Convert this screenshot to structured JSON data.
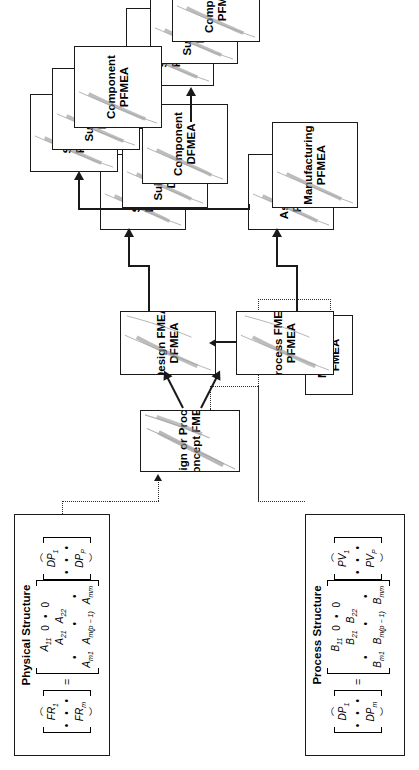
{
  "diagram": {
    "orientation": "rotated-90-ccw",
    "colors": {
      "stroke": "#1a1a1a",
      "background": "#ffffff",
      "swoosh": "#8c8c8c"
    }
  },
  "nodes": {
    "concept": {
      "line1": "Design or Process",
      "line2": "Concept FMEA"
    },
    "design_fmea": {
      "line1": "Design FMEA",
      "line2": "DFMEA"
    },
    "process_fmea": {
      "line1": "Process  FMEA",
      "line2": "PFMEA"
    },
    "machine_fmea": {
      "line1": "Machine",
      "line2": "FMEA"
    },
    "dfmea_stack": [
      {
        "line1": "System",
        "line2": "DFMEA"
      },
      {
        "line1": "Sub-system",
        "line2": "DFMEA"
      },
      {
        "line1": "Component",
        "line2": "DFMEA"
      }
    ],
    "pfmea_mid": [
      {
        "line1": "Assembly",
        "line2": "PFMEA"
      },
      {
        "line1": "Manufacturing",
        "line2": "PFMEA"
      }
    ],
    "pfmea_stack_upper": [
      {
        "line1": "System",
        "line2": "PFMEA"
      },
      {
        "line1": "Sub-system",
        "line2": "PFMEA"
      },
      {
        "line1": "Component",
        "line2": "PFMEA"
      }
    ],
    "pfmea_stack_lower": [
      {
        "line1": "System",
        "line2": "PFMEA"
      },
      {
        "line1": "Sub-system",
        "line2": "PFMEA"
      },
      {
        "line1": "Component",
        "line2": "PFMEA"
      }
    ]
  },
  "physical_structure": {
    "title": "Physical Structure",
    "lhs": {
      "first": "FR",
      "first_sub": "1",
      "dots": "•   •   •",
      "last": "FR",
      "last_sub": "m"
    },
    "equals": "=",
    "matrix": {
      "r1": [
        "A",
        "11",
        "0",
        "",
        "0"
      ],
      "r2": [
        "A",
        "21",
        "A",
        "22",
        "",
        "0"
      ],
      "r3": [
        "A",
        "m1",
        "",
        "",
        "A",
        "m(p − 1)",
        "A",
        "mm"
      ],
      "cells_text": {
        "a11": "A",
        "a11s": "11",
        "a21": "A",
        "a21s": "21",
        "am1": "A",
        "am1s": "m1",
        "zero1": "0",
        "a22": "A",
        "a22s": "22",
        "zero2": "0",
        "amp": "A",
        "amps": "m(p − 1)",
        "amm": "A",
        "amms": "mm",
        "dot": "•"
      }
    },
    "rhs": {
      "first": "DP",
      "first_sub": "1",
      "dots": "•   •   •",
      "last": "DP",
      "last_sub": "P"
    }
  },
  "process_structure": {
    "title": "Process Structure",
    "lhs": {
      "first": "DP",
      "first_sub": "1",
      "dots": "•   •   •",
      "last": "DP",
      "last_sub": "m"
    },
    "equals": "=",
    "matrix": {
      "cells_text": {
        "a11": "B",
        "a11s": "11",
        "a21": "B",
        "a21s": "21",
        "am1": "B",
        "am1s": "m1",
        "zero1": "0",
        "a22": "B",
        "a22s": "22",
        "zero2": "0",
        "amp": "B",
        "amps": "m(p − 1)",
        "amm": "B",
        "amms": "mm",
        "dot": "•"
      }
    },
    "rhs": {
      "first": "PV",
      "first_sub": "1",
      "dots": "•   •   •",
      "last": "PV",
      "last_sub": "P"
    }
  }
}
